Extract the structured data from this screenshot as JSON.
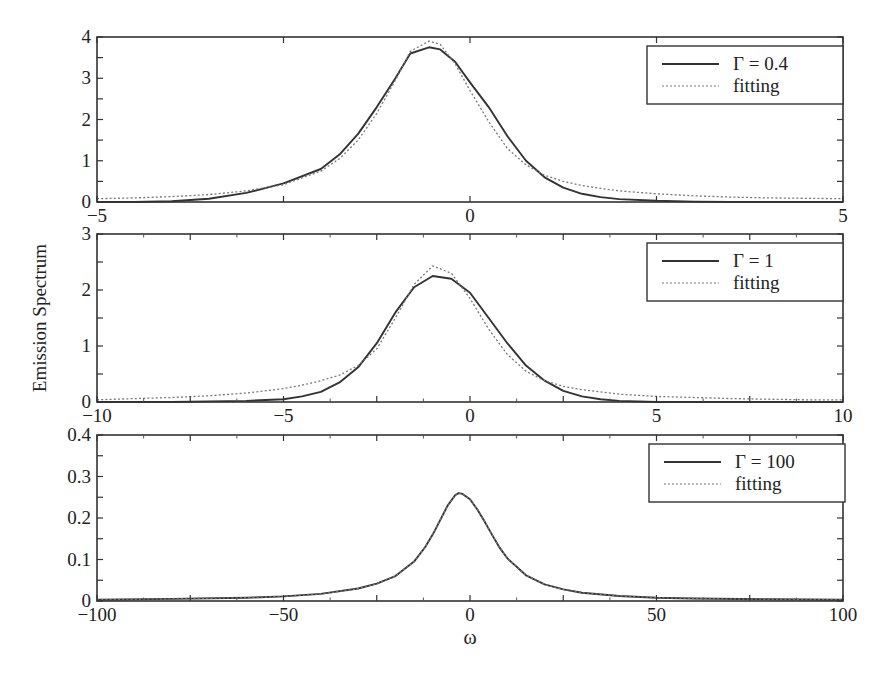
{
  "figure": {
    "ylabel": "Emission Spectrum",
    "xlabel": "ω"
  },
  "chart_data": [
    {
      "type": "line",
      "panel": 1,
      "title": "",
      "xlabel": "",
      "ylabel": "Emission Spectrum",
      "xlim": [
        -5,
        5
      ],
      "ylim": [
        0,
        4
      ],
      "xticks": [
        -5,
        0,
        5
      ],
      "xtick_labels": [
        "−5",
        "0",
        "5"
      ],
      "yticks": [
        0,
        1,
        2,
        3,
        4
      ],
      "ytick_labels": [
        "0",
        "1",
        "2",
        "3",
        "4"
      ],
      "grid": false,
      "legend_position": "upper right",
      "series": [
        {
          "name": "Γ = 0.4",
          "style": "solid",
          "x": [
            -5,
            -4.5,
            -4,
            -3.5,
            -3,
            -2.5,
            -2,
            -1.75,
            -1.5,
            -1.25,
            -1,
            -0.8,
            -0.55,
            -0.4,
            -0.2,
            0,
            0.25,
            0.5,
            0.75,
            1,
            1.25,
            1.5,
            1.75,
            2,
            2.5,
            3,
            3.5,
            4,
            4.5,
            5
          ],
          "y": [
            0.0,
            0.0,
            0.02,
            0.08,
            0.22,
            0.45,
            0.8,
            1.15,
            1.65,
            2.3,
            3.0,
            3.6,
            3.75,
            3.7,
            3.4,
            2.9,
            2.3,
            1.6,
            1.0,
            0.6,
            0.35,
            0.2,
            0.12,
            0.07,
            0.03,
            0.01,
            0.0,
            0.0,
            0.0,
            0.0
          ]
        },
        {
          "name": "fitting",
          "style": "dotted",
          "x": [
            -5,
            -4.5,
            -4,
            -3.5,
            -3,
            -2.5,
            -2,
            -1.75,
            -1.5,
            -1.25,
            -1,
            -0.8,
            -0.55,
            -0.4,
            -0.2,
            0,
            0.25,
            0.5,
            0.75,
            1,
            1.25,
            1.5,
            1.75,
            2,
            2.5,
            3,
            3.5,
            4,
            4.5,
            5
          ],
          "y": [
            0.08,
            0.1,
            0.13,
            0.18,
            0.27,
            0.42,
            0.75,
            1.05,
            1.5,
            2.15,
            2.95,
            3.65,
            3.9,
            3.82,
            3.35,
            2.7,
            1.95,
            1.3,
            0.9,
            0.65,
            0.5,
            0.4,
            0.33,
            0.27,
            0.2,
            0.15,
            0.12,
            0.1,
            0.09,
            0.08
          ]
        }
      ]
    },
    {
      "type": "line",
      "panel": 2,
      "title": "",
      "xlabel": "",
      "ylabel": "Emission Spectrum",
      "xlim": [
        -10,
        10
      ],
      "ylim": [
        0,
        3
      ],
      "xticks": [
        -10,
        -5,
        0,
        5,
        10
      ],
      "xtick_labels": [
        "−10",
        "−5",
        "0",
        "5",
        "10"
      ],
      "yticks": [
        0,
        1,
        2,
        3
      ],
      "ytick_labels": [
        "0",
        "1",
        "2",
        "3"
      ],
      "grid": false,
      "legend_position": "upper right",
      "series": [
        {
          "name": "Γ = 1",
          "style": "solid",
          "x": [
            -10,
            -9,
            -8,
            -7,
            -6,
            -5,
            -4.5,
            -4,
            -3.5,
            -3,
            -2.5,
            -2,
            -1.5,
            -1,
            -0.5,
            0,
            0.5,
            1,
            1.5,
            2,
            2.5,
            3,
            3.5,
            4,
            5,
            6,
            7,
            8,
            9,
            10
          ],
          "y": [
            0.0,
            0.0,
            0.0,
            0.01,
            0.02,
            0.05,
            0.1,
            0.18,
            0.35,
            0.62,
            1.05,
            1.6,
            2.05,
            2.25,
            2.2,
            1.95,
            1.5,
            1.05,
            0.65,
            0.38,
            0.2,
            0.1,
            0.05,
            0.02,
            0.0,
            0.0,
            0.0,
            0.0,
            0.0,
            0.0
          ]
        },
        {
          "name": "fitting",
          "style": "dotted",
          "x": [
            -10,
            -9,
            -8,
            -7,
            -6,
            -5,
            -4.5,
            -4,
            -3.5,
            -3,
            -2.5,
            -2,
            -1.5,
            -1,
            -0.5,
            0,
            0.5,
            1,
            1.5,
            2,
            2.5,
            3,
            3.5,
            4,
            5,
            6,
            7,
            8,
            9,
            10
          ],
          "y": [
            0.04,
            0.06,
            0.08,
            0.11,
            0.16,
            0.24,
            0.3,
            0.38,
            0.48,
            0.65,
            0.95,
            1.5,
            2.1,
            2.43,
            2.3,
            1.85,
            1.3,
            0.85,
            0.55,
            0.38,
            0.28,
            0.22,
            0.18,
            0.14,
            0.1,
            0.08,
            0.06,
            0.05,
            0.04,
            0.04
          ]
        }
      ]
    },
    {
      "type": "line",
      "panel": 3,
      "title": "",
      "xlabel": "ω",
      "ylabel": "Emission Spectrum",
      "xlim": [
        -100,
        100
      ],
      "ylim": [
        0,
        0.4
      ],
      "xticks": [
        -100,
        -50,
        0,
        50,
        100
      ],
      "xtick_labels": [
        "−100",
        "−50",
        "0",
        "50",
        "100"
      ],
      "yticks": [
        0,
        0.1,
        0.2,
        0.3,
        0.4
      ],
      "ytick_labels": [
        "0",
        "0.1",
        "0.2",
        "0.3",
        "0.4"
      ],
      "grid": false,
      "legend_position": "upper right",
      "series": [
        {
          "name": "Γ = 100",
          "style": "solid",
          "x": [
            -100,
            -80,
            -60,
            -50,
            -40,
            -30,
            -25,
            -20,
            -15,
            -12,
            -10,
            -8,
            -6,
            -4,
            -3,
            -2,
            0,
            2,
            4,
            6,
            8,
            10,
            15,
            20,
            25,
            30,
            40,
            50,
            60,
            80,
            100
          ],
          "y": [
            0.003,
            0.005,
            0.008,
            0.011,
            0.017,
            0.03,
            0.042,
            0.06,
            0.095,
            0.13,
            0.16,
            0.195,
            0.23,
            0.255,
            0.26,
            0.258,
            0.245,
            0.22,
            0.19,
            0.158,
            0.128,
            0.103,
            0.062,
            0.04,
            0.028,
            0.02,
            0.012,
            0.008,
            0.006,
            0.004,
            0.003
          ]
        },
        {
          "name": "fitting",
          "style": "dotted",
          "x": [
            -100,
            -80,
            -60,
            -50,
            -40,
            -30,
            -25,
            -20,
            -15,
            -12,
            -10,
            -8,
            -6,
            -4,
            -3,
            -2,
            0,
            2,
            4,
            6,
            8,
            10,
            15,
            20,
            25,
            30,
            40,
            50,
            60,
            80,
            100
          ],
          "y": [
            0.003,
            0.005,
            0.008,
            0.011,
            0.017,
            0.03,
            0.042,
            0.06,
            0.095,
            0.13,
            0.16,
            0.195,
            0.23,
            0.255,
            0.26,
            0.258,
            0.245,
            0.22,
            0.19,
            0.158,
            0.128,
            0.103,
            0.062,
            0.04,
            0.028,
            0.02,
            0.012,
            0.008,
            0.006,
            0.004,
            0.003
          ]
        }
      ]
    }
  ]
}
